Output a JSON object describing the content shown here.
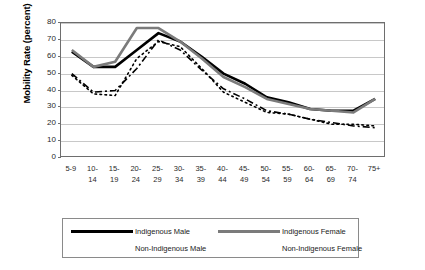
{
  "chart_data": {
    "type": "line",
    "title": "",
    "xlabel": "",
    "ylabel": "Mobility Rate (percent)",
    "ylim": [
      0,
      80
    ],
    "ytick_step": 10,
    "yticks": [
      80,
      70,
      60,
      50,
      40,
      30,
      20,
      10,
      0
    ],
    "grid": true,
    "legend_position": "bottom",
    "categories": [
      "5-9",
      "10-14",
      "15-19",
      "20-24",
      "25-29",
      "30-34",
      "35-39",
      "40-44",
      "45-49",
      "50-54",
      "55-59",
      "60-64",
      "65-69",
      "70-74",
      "75+"
    ],
    "category_lines": [
      [
        "5-9",
        ""
      ],
      [
        "10-",
        "14"
      ],
      [
        "15-",
        "19"
      ],
      [
        "20-",
        "24"
      ],
      [
        "25-",
        "29"
      ],
      [
        "30-",
        "34"
      ],
      [
        "35-",
        "39"
      ],
      [
        "40-",
        "44"
      ],
      [
        "45-",
        "49"
      ],
      [
        "50-",
        "54"
      ],
      [
        "55-",
        "59"
      ],
      [
        "60-",
        "64"
      ],
      [
        "65-",
        "69"
      ],
      [
        "70-",
        "74"
      ],
      [
        "75+",
        ""
      ]
    ],
    "series": [
      {
        "name": "Indigenous Male",
        "style": "solid",
        "color": "#000000",
        "width": 2.6,
        "values": [
          63,
          54,
          54,
          64,
          74,
          69,
          60,
          50,
          44,
          36,
          33,
          29,
          28,
          28,
          35
        ]
      },
      {
        "name": "Indigenous Female",
        "style": "solid",
        "color": "#7b7b7b",
        "width": 2.6,
        "values": [
          64,
          54,
          57,
          77,
          77,
          69,
          59,
          48,
          42,
          35,
          32,
          29,
          28,
          27,
          35
        ]
      },
      {
        "name": "Non-Indigenous Male",
        "style": "dashdot",
        "color": "#000000",
        "width": 1.6,
        "values": [
          50,
          39,
          40,
          53,
          70,
          64,
          52,
          41,
          35,
          28,
          26,
          23,
          21,
          19,
          18
        ]
      },
      {
        "name": "Non-Indigenous Female",
        "style": "dotted",
        "color": "#000000",
        "width": 1.6,
        "values": [
          49,
          38,
          37,
          59,
          69,
          66,
          53,
          39,
          33,
          27,
          26,
          23,
          20,
          20,
          19
        ]
      }
    ]
  },
  "axis": {
    "y_title": "Mobility Rate (percent)"
  },
  "legend": {
    "entries": [
      {
        "label": "Indigenous Male",
        "key": "solid-black-key"
      },
      {
        "label": "Indigenous Female",
        "key": "solid-grey-key"
      },
      {
        "label": "Non-Indigenous Male",
        "key": "dash-dot-key"
      },
      {
        "label": "Non-Indigenous Female",
        "key": "dotted-key"
      }
    ]
  },
  "colors": {
    "indigenous_male": "#000000",
    "indigenous_female": "#7b7b7b",
    "non_indigenous_male": "#000000",
    "non_indigenous_female": "#000000",
    "gridline": "#c8c8c8",
    "frame": "#6e6e6e",
    "background": "#ffffff"
  }
}
